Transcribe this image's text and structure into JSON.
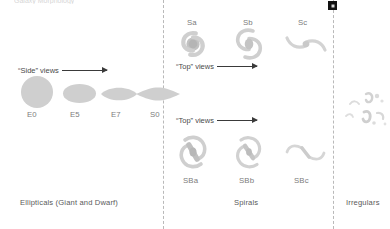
{
  "figure": {
    "title_fragment": "Galaxy Morphology",
    "width": 390,
    "height": 229,
    "background_color": "#ffffff",
    "galaxy_fill_color": "#cfcfcf",
    "text_color": "#4a4a4a",
    "divider_color": "#b9b9b9"
  },
  "annotations": {
    "side_views": "“Side” views",
    "top_views_upper": "“Top” views",
    "top_views_lower": "“Top” views"
  },
  "sections": {
    "ellipticals": {
      "caption": "Ellipticals (Giant and Dwarf)",
      "types": [
        {
          "label": "E0",
          "shape": "circle"
        },
        {
          "label": "E5",
          "shape": "ellipse"
        },
        {
          "label": "E7",
          "shape": "lens"
        },
        {
          "label": "S0",
          "shape": "thin-lens"
        }
      ]
    },
    "spirals": {
      "caption": "Spirals",
      "normal": [
        {
          "label": "Sa",
          "shape": "tight-spiral"
        },
        {
          "label": "Sb",
          "shape": "medium-spiral"
        },
        {
          "label": "Sc",
          "shape": "open-spiral"
        }
      ],
      "barred": [
        {
          "label": "SBa",
          "shape": "barred-tight-spiral"
        },
        {
          "label": "SBb",
          "shape": "barred-medium-spiral"
        },
        {
          "label": "SBc",
          "shape": "barred-open-spiral"
        }
      ]
    },
    "irregulars": {
      "caption": "Irregulars"
    }
  },
  "markers": {
    "corner_marker": "page-marker"
  }
}
